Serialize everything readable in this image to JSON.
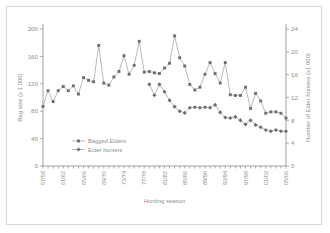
{
  "figure": {
    "background": "#ffffff",
    "border_color": "#d8d8d8",
    "ink_color": "#8e8e8e",
    "marker_color": "#6e6e6e"
  },
  "chart_data": {
    "type": "line",
    "title": "",
    "xlabel": "Hunting season",
    "ylabel": "Bag size (x 1 000)",
    "y2label": "Number of Eider hunters (x1 000)",
    "grid": false,
    "legend_position": "inside-lower-left",
    "ylim": [
      0,
      200
    ],
    "yticks": [
      0,
      40,
      80,
      120,
      160,
      200
    ],
    "y2lim": [
      0,
      24
    ],
    "y2ticks": [
      0,
      4,
      8,
      12,
      16,
      20,
      24
    ],
    "xtick_labels": [
      "57/58",
      "61/62",
      "65/66",
      "69/70",
      "73/74",
      "77/78",
      "81/82",
      "85/86",
      "89/90",
      "93/94",
      "97/98",
      "01/02",
      "05/06"
    ],
    "xtick_positions": [
      0,
      4,
      8,
      12,
      16,
      20,
      24,
      28,
      32,
      36,
      40,
      44,
      48
    ],
    "x": [
      "57/58",
      "58/59",
      "59/60",
      "60/61",
      "61/62",
      "62/63",
      "63/64",
      "64/65",
      "65/66",
      "66/67",
      "67/68",
      "68/69",
      "69/70",
      "70/71",
      "71/72",
      "72/73",
      "73/74",
      "74/75",
      "75/76",
      "76/77",
      "77/78",
      "78/79",
      "79/80",
      "80/81",
      "81/82",
      "82/83",
      "83/84",
      "84/85",
      "85/86",
      "86/87",
      "87/88",
      "88/89",
      "89/90",
      "90/91",
      "91/92",
      "92/93",
      "93/94",
      "94/95",
      "95/96",
      "96/97",
      "97/98",
      "98/99",
      "99/00",
      "00/01",
      "01/02",
      "02/03",
      "03/04",
      "04/05",
      "05/06"
    ],
    "series": [
      {
        "name": "Bagged Eiders",
        "axis": "left",
        "units": "x 1 000 birds",
        "values": [
          87,
          110,
          94,
          110,
          116,
          110,
          117,
          105,
          129,
          125,
          123,
          176,
          121,
          118,
          130,
          138,
          161,
          134,
          147,
          182,
          137,
          138,
          136,
          135,
          143,
          150,
          190,
          158,
          146,
          119,
          111,
          115,
          134,
          151,
          135,
          121,
          151,
          104,
          103,
          103,
          115,
          84,
          106,
          95,
          77,
          79,
          79,
          77,
          70
        ]
      },
      {
        "name": "Eider hunters",
        "axis": "right",
        "units": "x 1 000 hunters",
        "values": [
          null,
          null,
          null,
          null,
          null,
          null,
          null,
          null,
          null,
          null,
          null,
          null,
          null,
          null,
          null,
          null,
          null,
          null,
          null,
          null,
          null,
          14.3,
          12.4,
          14.3,
          13.0,
          11.5,
          10.4,
          9.6,
          9.3,
          10.2,
          10.3,
          10.2,
          10.3,
          10.2,
          10.7,
          9.4,
          8.5,
          8.4,
          8.6,
          8.0,
          7.3,
          8.0,
          7.2,
          6.8,
          6.3,
          6.1,
          6.3,
          6.1,
          6.1
        ]
      }
    ]
  },
  "legend": {
    "items": [
      {
        "label": "Bagged Eiders"
      },
      {
        "label": "Eider hunters"
      }
    ]
  }
}
